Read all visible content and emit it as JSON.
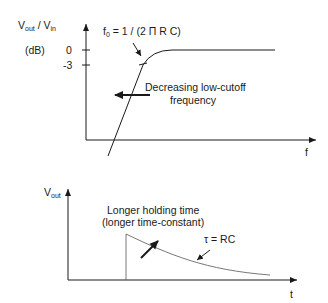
{
  "top_plot": {
    "y_label_main": "V",
    "y_label_sub1": "out",
    "y_label_sep": " / V",
    "y_label_sub2": "in",
    "y_unit": "(dB)",
    "tick_0": "0",
    "tick_neg3": "-3",
    "x_label": "f",
    "f0_main": "f",
    "f0_sub": "0",
    "f0_rest": " = 1 / (2 Π R C)",
    "annotation_line1": "Decreasing low-cutoff",
    "annotation_line2": "frequency"
  },
  "bottom_plot": {
    "y_label_main": "V",
    "y_label_sub": "out",
    "x_label": "t",
    "annotation_line1": "Longer holding time",
    "annotation_line2": "(longer time-constant)",
    "tau_label": "τ = RC"
  },
  "colors": {
    "axis": "#1a1a1a",
    "curve": "#1a1a1a",
    "decay_curve": "#555555"
  }
}
